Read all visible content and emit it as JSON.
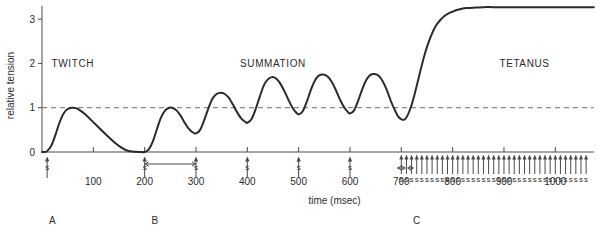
{
  "chart_data": {
    "type": "line",
    "title": "",
    "xlabel": "time (msec)",
    "ylabel": "relative tension",
    "xlim": [
      0,
      1075
    ],
    "ylim": [
      0,
      3.3
    ],
    "grid": false,
    "legend_position": "none",
    "x_ticks": [
      100,
      200,
      300,
      400,
      500,
      600,
      700,
      800,
      900,
      1000
    ],
    "x_tick_labels": [
      "100",
      "200",
      "300",
      "400",
      "500",
      "600",
      "700",
      "800",
      "900",
      "1000"
    ],
    "y_ticks": [
      0,
      1,
      2,
      3
    ],
    "y_tick_labels": [
      "0",
      "1",
      "2",
      "3"
    ],
    "reference_line": {
      "y": 1,
      "style": "dashed",
      "label": ""
    },
    "annotations": [
      {
        "id": "twitch",
        "text": "TWITCH",
        "x": 60,
        "y": 2.0
      },
      {
        "id": "summation",
        "text": "SUMMATION",
        "x": 450,
        "y": 2.0
      },
      {
        "id": "tetanus",
        "text": "TETANUS",
        "x": 940,
        "y": 2.0
      }
    ],
    "panel_labels": [
      {
        "id": "A",
        "text": "A",
        "x": 20
      },
      {
        "id": "B",
        "text": "B",
        "x": 220
      },
      {
        "id": "C",
        "text": "C",
        "x": 730
      }
    ],
    "stimulus_label": "s",
    "stimuli_single": [
      10,
      200,
      300,
      400,
      500,
      600
    ],
    "stimuli_train_start": 700,
    "stimuli_train_count": 37,
    "stimuli_train_interval": 10,
    "interval_arrows": [
      {
        "id": "summation-interval",
        "from": 200,
        "to": 300
      },
      {
        "id": "tetanus-interval-1",
        "from": 692,
        "to": 708
      },
      {
        "id": "tetanus-interval-2",
        "from": 712,
        "to": 724
      }
    ],
    "series": [
      {
        "name": "relative tension",
        "points": [
          [
            0,
            0.0
          ],
          [
            5,
            0.0
          ],
          [
            10,
            0.02
          ],
          [
            18,
            0.14
          ],
          [
            26,
            0.38
          ],
          [
            34,
            0.66
          ],
          [
            42,
            0.87
          ],
          [
            50,
            0.97
          ],
          [
            58,
            1.0
          ],
          [
            66,
            0.99
          ],
          [
            74,
            0.94
          ],
          [
            84,
            0.85
          ],
          [
            96,
            0.72
          ],
          [
            110,
            0.56
          ],
          [
            124,
            0.4
          ],
          [
            138,
            0.25
          ],
          [
            152,
            0.12
          ],
          [
            164,
            0.04
          ],
          [
            176,
            0.01
          ],
          [
            190,
            0.0
          ],
          [
            200,
            0.0
          ],
          [
            208,
            0.06
          ],
          [
            216,
            0.24
          ],
          [
            224,
            0.52
          ],
          [
            232,
            0.78
          ],
          [
            240,
            0.94
          ],
          [
            248,
            1.0
          ],
          [
            254,
            1.0
          ],
          [
            262,
            0.94
          ],
          [
            270,
            0.82
          ],
          [
            278,
            0.66
          ],
          [
            286,
            0.52
          ],
          [
            294,
            0.44
          ],
          [
            300,
            0.42
          ],
          [
            308,
            0.5
          ],
          [
            316,
            0.72
          ],
          [
            324,
            0.98
          ],
          [
            332,
            1.2
          ],
          [
            340,
            1.31
          ],
          [
            348,
            1.34
          ],
          [
            356,
            1.31
          ],
          [
            364,
            1.22
          ],
          [
            372,
            1.07
          ],
          [
            380,
            0.9
          ],
          [
            388,
            0.76
          ],
          [
            396,
            0.68
          ],
          [
            400,
            0.66
          ],
          [
            408,
            0.74
          ],
          [
            416,
            0.96
          ],
          [
            424,
            1.24
          ],
          [
            432,
            1.5
          ],
          [
            440,
            1.64
          ],
          [
            448,
            1.69
          ],
          [
            456,
            1.66
          ],
          [
            464,
            1.55
          ],
          [
            472,
            1.38
          ],
          [
            480,
            1.18
          ],
          [
            488,
            1.0
          ],
          [
            496,
            0.88
          ],
          [
            500,
            0.85
          ],
          [
            508,
            0.92
          ],
          [
            516,
            1.14
          ],
          [
            524,
            1.41
          ],
          [
            532,
            1.62
          ],
          [
            540,
            1.73
          ],
          [
            548,
            1.75
          ],
          [
            556,
            1.71
          ],
          [
            564,
            1.59
          ],
          [
            572,
            1.41
          ],
          [
            580,
            1.2
          ],
          [
            588,
            1.02
          ],
          [
            596,
            0.9
          ],
          [
            600,
            0.87
          ],
          [
            608,
            0.94
          ],
          [
            616,
            1.16
          ],
          [
            624,
            1.42
          ],
          [
            632,
            1.63
          ],
          [
            640,
            1.74
          ],
          [
            648,
            1.76
          ],
          [
            656,
            1.72
          ],
          [
            664,
            1.59
          ],
          [
            672,
            1.39
          ],
          [
            680,
            1.14
          ],
          [
            688,
            0.93
          ],
          [
            694,
            0.8
          ],
          [
            700,
            0.74
          ],
          [
            706,
            0.73
          ],
          [
            712,
            0.82
          ],
          [
            720,
            1.06
          ],
          [
            728,
            1.4
          ],
          [
            736,
            1.78
          ],
          [
            744,
            2.14
          ],
          [
            752,
            2.44
          ],
          [
            760,
            2.68
          ],
          [
            768,
            2.86
          ],
          [
            776,
            2.98
          ],
          [
            784,
            3.07
          ],
          [
            792,
            3.13
          ],
          [
            800,
            3.17
          ],
          [
            810,
            3.21
          ],
          [
            820,
            3.24
          ],
          [
            830,
            3.25
          ],
          [
            845,
            3.26
          ],
          [
            860,
            3.27
          ],
          [
            880,
            3.27
          ],
          [
            920,
            3.27
          ],
          [
            980,
            3.27
          ],
          [
            1040,
            3.27
          ],
          [
            1075,
            3.27
          ]
        ]
      }
    ]
  }
}
